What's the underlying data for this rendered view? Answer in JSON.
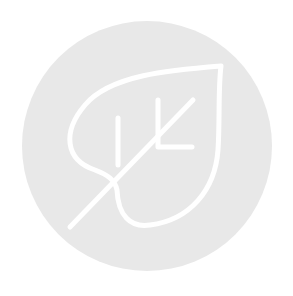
{
  "icon": {
    "semantic": "leaf-icon",
    "description": "White outlined leaf with stem and veins inside a light gray circle",
    "colors": {
      "circle_fill": "#e8e8e8",
      "stroke": "#ffffff",
      "background": "#ffffff"
    }
  }
}
